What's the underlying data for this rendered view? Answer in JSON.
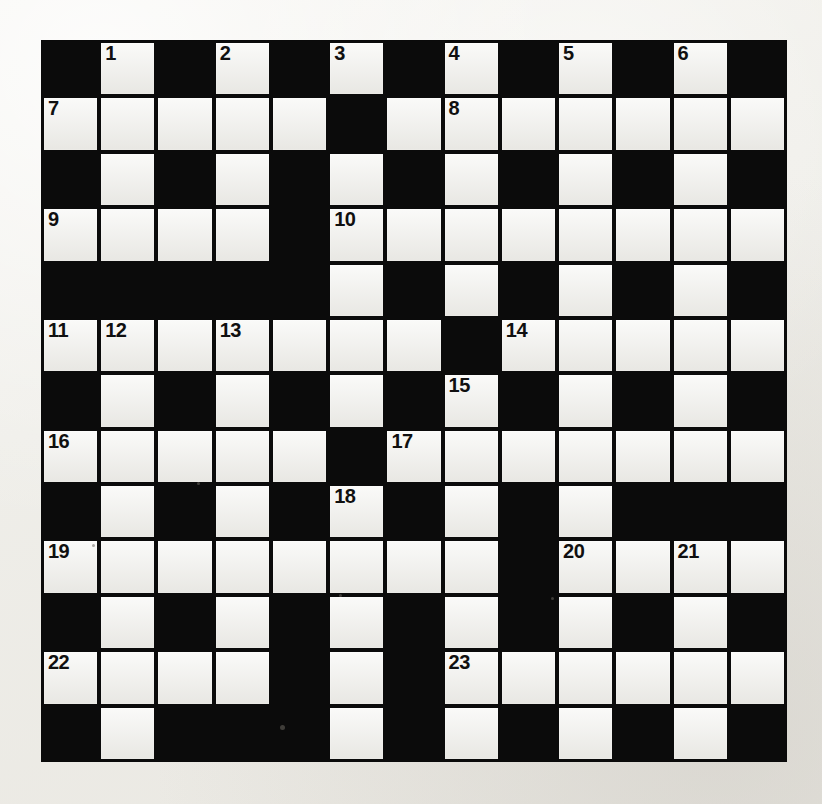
{
  "puzzle": {
    "kind": "crossword-grid",
    "rows": 13,
    "cols": 13,
    "cell_size_px": 57,
    "colors": {
      "block": "#0b0b0b",
      "light": "#f4f4f1",
      "paper": "#f0efea",
      "number_text": "#101010"
    },
    "layout_legend": {
      "#": "blocked (black) square",
      ".": "open (light) square"
    },
    "layout": [
      "#.#.#.#.#.#.#",
      ".....#.......",
      "#.#.#.#.#.#.#",
      "....#........",
      "#####.#.#.#.#",
      ".......#.....",
      "#.#.#.#.#.#.#",
      ".....#.......",
      "#.#.#.#.#.###",
      "........#....",
      "#.#.#.#.#.#.#",
      "....#.#......",
      "#.###.#.#.#.#"
    ],
    "numbers": [
      {
        "n": "1",
        "row": 0,
        "col": 1
      },
      {
        "n": "2",
        "row": 0,
        "col": 3
      },
      {
        "n": "3",
        "row": 0,
        "col": 5
      },
      {
        "n": "4",
        "row": 0,
        "col": 7
      },
      {
        "n": "5",
        "row": 0,
        "col": 9
      },
      {
        "n": "6",
        "row": 0,
        "col": 11
      },
      {
        "n": "7",
        "row": 1,
        "col": 0
      },
      {
        "n": "8",
        "row": 1,
        "col": 7
      },
      {
        "n": "9",
        "row": 3,
        "col": 0
      },
      {
        "n": "10",
        "row": 3,
        "col": 5
      },
      {
        "n": "11",
        "row": 5,
        "col": 0
      },
      {
        "n": "12",
        "row": 5,
        "col": 1
      },
      {
        "n": "13",
        "row": 5,
        "col": 3
      },
      {
        "n": "14",
        "row": 5,
        "col": 8
      },
      {
        "n": "15",
        "row": 6,
        "col": 7
      },
      {
        "n": "16",
        "row": 7,
        "col": 0
      },
      {
        "n": "17",
        "row": 7,
        "col": 6
      },
      {
        "n": "18",
        "row": 8,
        "col": 5
      },
      {
        "n": "19",
        "row": 9,
        "col": 0
      },
      {
        "n": "20",
        "row": 9,
        "col": 9
      },
      {
        "n": "21",
        "row": 9,
        "col": 11
      },
      {
        "n": "22",
        "row": 11,
        "col": 0
      },
      {
        "n": "23",
        "row": 11,
        "col": 7
      }
    ],
    "entered_letters": [],
    "specks": [
      {
        "x": 238,
        "y": 684,
        "d": 5
      },
      {
        "x": 155,
        "y": 441,
        "d": 3
      },
      {
        "x": 297,
        "y": 553,
        "d": 3
      },
      {
        "x": 509,
        "y": 556,
        "d": 3
      },
      {
        "x": 50,
        "y": 503,
        "d": 3
      }
    ]
  }
}
